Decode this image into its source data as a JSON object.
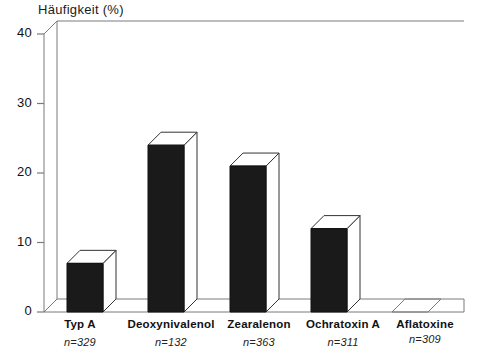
{
  "chart_data": {
    "type": "bar",
    "title": "Häufigkeit (%)",
    "xlabel": "",
    "ylabel": "Häufigkeit (%)",
    "ylim": [
      0,
      40
    ],
    "yticks": [
      0,
      10,
      20,
      30,
      40
    ],
    "grid": false,
    "legend": "none",
    "style": "3d-bar",
    "categories": [
      "Typ A",
      "Deoxynivalenol",
      "Zearalenon",
      "Ochratoxin A",
      "Aflatoxine"
    ],
    "values": [
      7,
      24,
      21,
      12,
      0
    ],
    "sample_sizes": [
      "n=329",
      "n=132",
      "n=363",
      "n=311",
      "n=309"
    ],
    "annotations": []
  },
  "chart": {
    "title": "Häufigkeit (%)",
    "y_axis": {
      "ticks": [
        {
          "label": "40",
          "value": 40
        },
        {
          "label": "30",
          "value": 30
        },
        {
          "label": "20",
          "value": 20
        },
        {
          "label": "10",
          "value": 10
        },
        {
          "label": "0",
          "value": 0
        }
      ]
    },
    "bars": [
      {
        "label": "Typ A",
        "n": "n=329",
        "value": 7
      },
      {
        "label": "Deoxynivalenol",
        "n": "n=132",
        "value": 24
      },
      {
        "label": "Zearalenon",
        "n": "n=363",
        "value": 21
      },
      {
        "label": "Ochratoxin A",
        "n": "n=311",
        "value": 12
      },
      {
        "label": "Aflatoxine",
        "n": "n=309",
        "value": 0
      }
    ],
    "colors": {
      "bar_fill": "#1a1a1a",
      "bar_top": "#ffffff",
      "bar_side": "#ffffff",
      "frame": "#7a7a7a",
      "text": "#111111"
    }
  }
}
